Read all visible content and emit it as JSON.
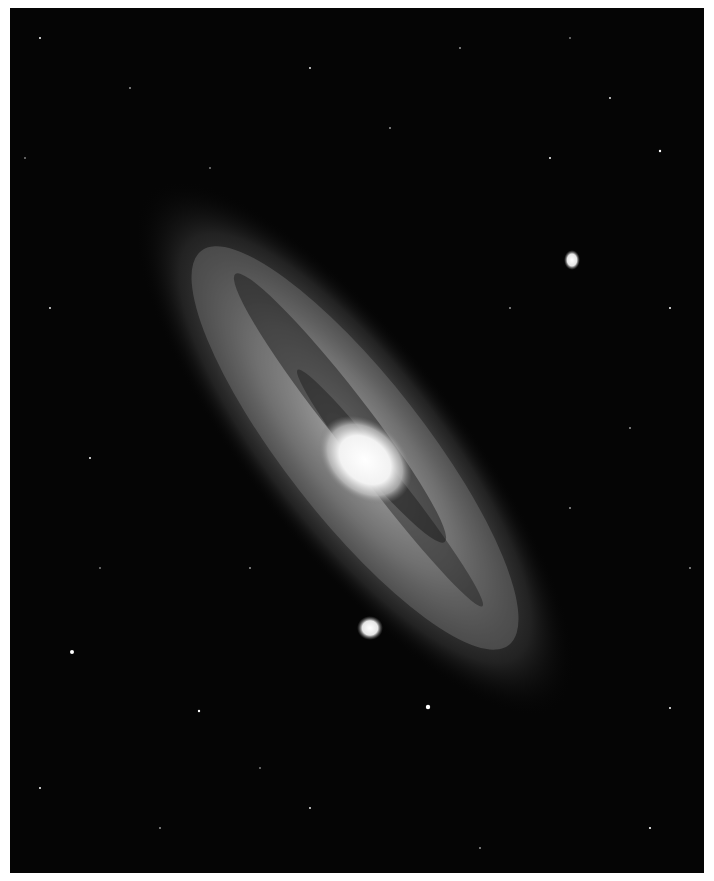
{
  "image": {
    "subject": "Andromeda galaxy (spiral galaxy) astronomical photograph",
    "style": "black and white",
    "features": [
      "galaxy-core",
      "spiral-arms",
      "dust-lanes",
      "satellite-galaxy-upper-right",
      "satellite-galaxy-lower-left",
      "star-field"
    ]
  },
  "caption": {
    "text": ""
  },
  "colors": {
    "sky": "#050505",
    "core": "#f4f4f4",
    "page": "#ffffff"
  }
}
